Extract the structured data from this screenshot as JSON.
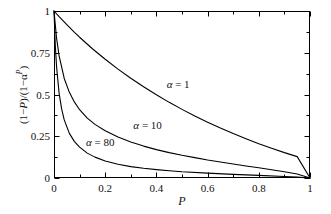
{
  "chart_data": {
    "type": "line",
    "title": "",
    "xlabel": "P",
    "ylabel": "(1−P)/(1−α^P)",
    "xlim": [
      0,
      1
    ],
    "ylim": [
      0,
      1
    ],
    "grid": false,
    "legend_position": "inline-annotations",
    "x_ticks": [
      "0",
      "0.2",
      "0.4",
      "0.6",
      "0.8",
      "1"
    ],
    "x_tick_values": [
      0,
      0.2,
      0.4,
      0.6,
      0.8,
      1
    ],
    "x_minor_tick_values": [
      0.1,
      0.3,
      0.5,
      0.7,
      0.9
    ],
    "y_ticks": [
      "0",
      "0.25",
      "0.5",
      "0.75",
      "1"
    ],
    "y_tick_values": [
      0,
      0.25,
      0.5,
      0.75,
      1
    ],
    "y_minor_tick_values": [
      0.125,
      0.375,
      0.625,
      0.875
    ],
    "line_color": "#000000",
    "series": [
      {
        "name": "α = 1",
        "alpha": 1,
        "label_x": 0.44,
        "label_y": 0.56,
        "x": [
          0,
          0.02,
          0.05,
          0.08,
          0.1,
          0.15,
          0.2,
          0.25,
          0.3,
          0.35,
          0.4,
          0.45,
          0.5,
          0.55,
          0.6,
          0.65,
          0.7,
          0.75,
          0.8,
          0.85,
          0.9,
          0.95,
          1
        ],
        "values": [
          1,
          0.966,
          0.918,
          0.872,
          0.843,
          0.774,
          0.711,
          0.652,
          0.597,
          0.546,
          0.498,
          0.453,
          0.411,
          0.371,
          0.334,
          0.299,
          0.266,
          0.235,
          0.205,
          0.178,
          0.152,
          0.128,
          0
        ]
      },
      {
        "name": "α = 10",
        "alpha": 10,
        "label_x": 0.31,
        "label_y": 0.315,
        "x": [
          0,
          0.01,
          0.02,
          0.04,
          0.06,
          0.08,
          0.1,
          0.13,
          0.16,
          0.2,
          0.25,
          0.3,
          0.35,
          0.4,
          0.45,
          0.5,
          0.55,
          0.6,
          0.65,
          0.7,
          0.75,
          0.8,
          0.85,
          0.9,
          0.95,
          1
        ],
        "values": [
          1,
          0.838,
          0.731,
          0.596,
          0.513,
          0.454,
          0.409,
          0.359,
          0.321,
          0.283,
          0.245,
          0.215,
          0.191,
          0.17,
          0.152,
          0.136,
          0.122,
          0.108,
          0.096,
          0.084,
          0.072,
          0.061,
          0.049,
          0.037,
          0.024,
          0
        ]
      },
      {
        "name": "α = 80",
        "alpha": 80,
        "label_x": 0.125,
        "label_y": 0.215,
        "x": [
          0,
          0.005,
          0.01,
          0.02,
          0.03,
          0.04,
          0.06,
          0.08,
          0.1,
          0.13,
          0.16,
          0.2,
          0.25,
          0.3,
          0.35,
          0.4,
          0.45,
          0.5,
          0.6,
          0.7,
          0.8,
          0.9,
          0.95,
          1
        ],
        "values": [
          1,
          0.797,
          0.667,
          0.507,
          0.412,
          0.348,
          0.267,
          0.218,
          0.185,
          0.149,
          0.125,
          0.102,
          0.082,
          0.068,
          0.058,
          0.05,
          0.043,
          0.037,
          0.029,
          0.022,
          0.016,
          0.009,
          0.005,
          0
        ]
      }
    ]
  },
  "plot_frame": {
    "left": 54,
    "top": 11,
    "right": 310,
    "bottom": 178
  }
}
